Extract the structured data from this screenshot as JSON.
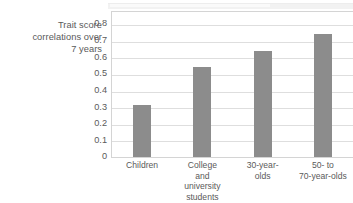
{
  "chart_data": {
    "type": "bar",
    "title": "",
    "subtitle": "",
    "xlabel": "",
    "ylabel": "Trait score correlations over 7 years",
    "ylabel_lines": [
      "Trait score",
      "correlations over",
      "7 years"
    ],
    "categories": [
      "Children",
      "College and university students",
      "30-year-olds",
      "50- to 70-year-olds"
    ],
    "category_lines": [
      [
        "Children"
      ],
      [
        "College",
        "and",
        "university",
        "students"
      ],
      [
        "30-year-",
        "olds"
      ],
      [
        "50-  to",
        "70-year-olds"
      ]
    ],
    "values": [
      0.31,
      0.54,
      0.64,
      0.74
    ],
    "ylim": [
      0,
      0.8
    ],
    "ytick_labels": [
      "0.8",
      "0.7",
      "0.6",
      "0.5",
      "0.4",
      "0.3",
      "0.2",
      "0.1",
      "0"
    ],
    "ytick_values": [
      0.8,
      0.7,
      0.6,
      0.5,
      0.4,
      0.3,
      0.2,
      0.1,
      0
    ],
    "grid": "horizontal",
    "legend": "none",
    "bar_color": "#8c8c8c",
    "grid_color": "#dedede",
    "frame_color": "#d4d4d4",
    "text_color": "#5a5a5a"
  }
}
